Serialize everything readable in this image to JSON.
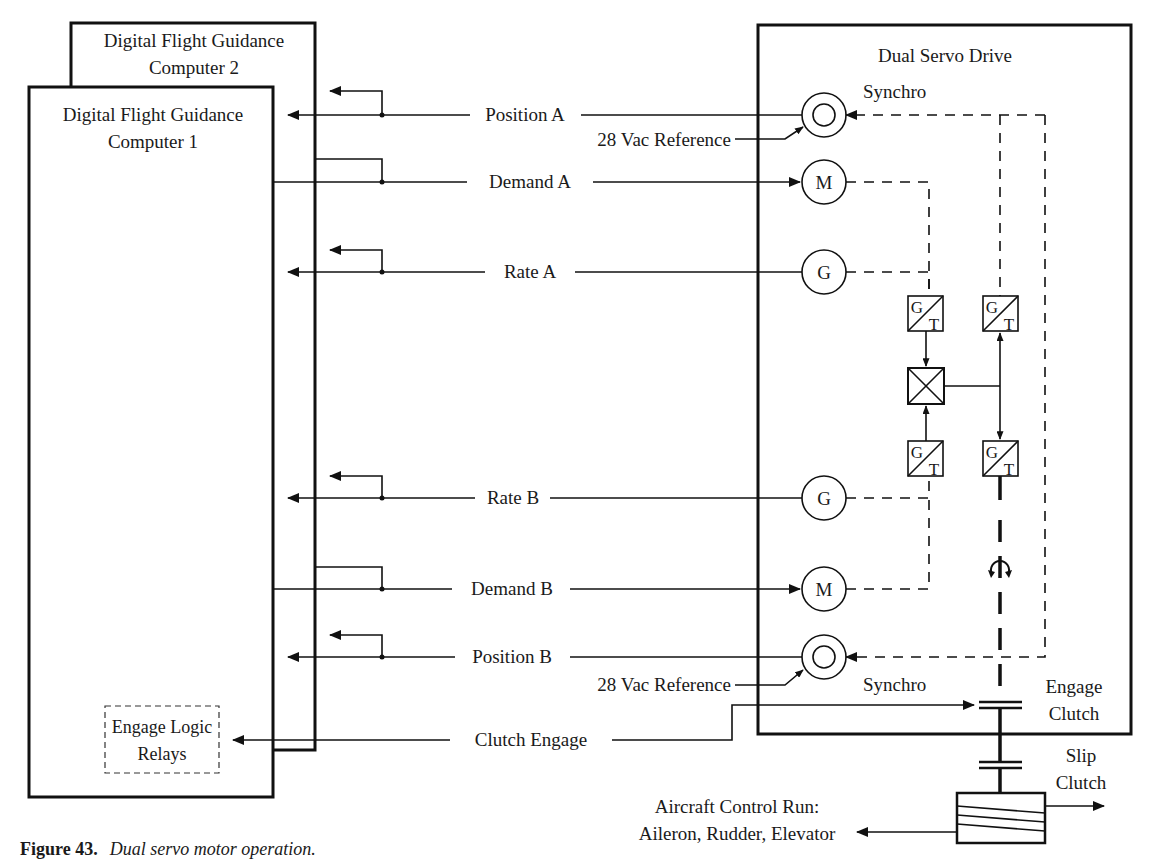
{
  "computer2": {
    "title_line1": "Digital Flight Guidance",
    "title_line2": "Computer 2"
  },
  "computer1": {
    "title_line1": "Digital Flight Guidance",
    "title_line2": "Computer 1"
  },
  "engage_logic": {
    "line1": "Engage Logic",
    "line2": "Relays"
  },
  "servo": {
    "title": "Dual Servo Drive"
  },
  "signals": {
    "position_a": "Position A",
    "ref_a": "28 Vac Reference",
    "demand_a": "Demand A",
    "rate_a": "Rate A",
    "rate_b": "Rate B",
    "demand_b": "Demand B",
    "position_b": "Position B",
    "ref_b": "28 Vac Reference",
    "clutch_engage": "Clutch Engage"
  },
  "components": {
    "synchro_a_label": "Synchro",
    "synchro_b_label": "Synchro",
    "motor_glyph": "M",
    "generator_glyph": "G",
    "gt_top": "G",
    "gt_bottom": "T"
  },
  "clutches": {
    "engage_line1": "Engage",
    "engage_line2": "Clutch",
    "slip_line1": "Slip",
    "slip_line2": "Clutch"
  },
  "output": {
    "line1": "Aircraft Control Run:",
    "line2": "Aileron, Rudder, Elevator"
  },
  "caption": {
    "number": "Figure 43.",
    "text": "Dual servo motor operation."
  }
}
